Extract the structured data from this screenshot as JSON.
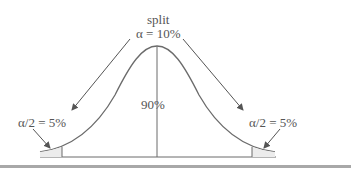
{
  "diagram": {
    "type": "normal-distribution-two-tailed",
    "top_label": "split",
    "alpha_label": "α = 10%",
    "center_label": "90%",
    "left_tail_label": "α/2 = 5%",
    "right_tail_label": "α/2 = 5%",
    "colors": {
      "line": "#6b6b6b",
      "text": "#555555",
      "rule": "#a8a8a8"
    }
  }
}
